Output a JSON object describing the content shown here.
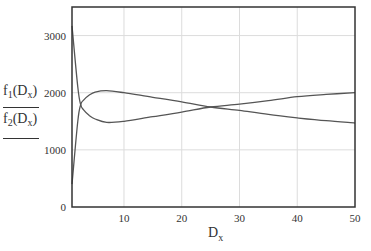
{
  "chart_data": {
    "type": "line",
    "title": "",
    "xlabel": "D_x",
    "ylabel": "f1(D_x), f2(D_x)",
    "xlim": [
      1,
      50
    ],
    "ylim": [
      0,
      3500
    ],
    "x_ticks": [
      10,
      20,
      30,
      40,
      50
    ],
    "y_ticks": [
      0,
      1000,
      2000,
      3000
    ],
    "grid": true,
    "legend": "none",
    "x": [
      1,
      2,
      2.5,
      3,
      4,
      5,
      7,
      10,
      15,
      20,
      25,
      30,
      35,
      40,
      45,
      50
    ],
    "series": [
      {
        "name": "f1(D_x)",
        "values": [
          400,
          1500,
          1790,
          1870,
          1960,
          2010,
          2035,
          2000,
          1920,
          1840,
          1750,
          1690,
          1620,
          1560,
          1510,
          1470
        ]
      },
      {
        "name": "f2(D_x)",
        "values": [
          3170,
          2100,
          1790,
          1700,
          1600,
          1540,
          1480,
          1500,
          1580,
          1660,
          1750,
          1800,
          1860,
          1930,
          1970,
          2000
        ]
      }
    ]
  },
  "labels": {
    "y_f1": "f",
    "y_f1_sub": "1",
    "y_f2": "f",
    "y_f2_sub": "2",
    "arg": "D",
    "arg_sub": "x",
    "x_main": "D",
    "x_sub": "x"
  }
}
